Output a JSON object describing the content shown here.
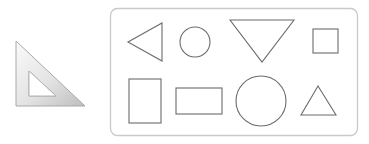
{
  "scene": {
    "width": 369,
    "height": 144,
    "background": "#ffffff"
  },
  "set_square": {
    "label": "set-square ruler",
    "fill_light": "#f4f4f4",
    "fill_dark": "#c8c8c8",
    "edge": "#a9a9a9"
  },
  "panel": {
    "border_color": "#c9c9c9",
    "fill": "#ffffff",
    "shape_stroke": "#6b6b6b",
    "shapes": [
      {
        "type": "triangle-left"
      },
      {
        "type": "circle-small"
      },
      {
        "type": "triangle-down"
      },
      {
        "type": "square"
      },
      {
        "type": "rectangle-tall"
      },
      {
        "type": "rectangle-wide"
      },
      {
        "type": "circle-large"
      },
      {
        "type": "triangle-up"
      }
    ]
  }
}
